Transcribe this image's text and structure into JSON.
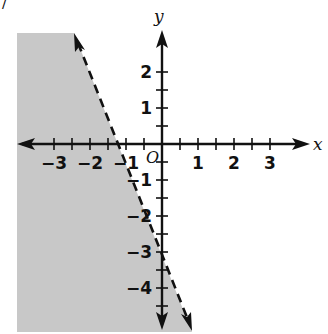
{
  "chart_data": {
    "type": "inequality-graph",
    "title": "",
    "xlabel": "x",
    "ylabel": "y",
    "origin_label": "O",
    "xlim": [
      -3.9,
      4.0
    ],
    "ylim": [
      -5.2,
      3.1
    ],
    "x_tick_step": 0.5,
    "y_tick_step": 0.5,
    "x_tick_labels": [
      "−3",
      "−2",
      "−1",
      "1",
      "2",
      "3"
    ],
    "x_tick_values": [
      -3,
      -2,
      -1,
      1,
      2,
      3
    ],
    "y_tick_labels": [
      "2",
      "1",
      "−1",
      "−2",
      "−3",
      "−4"
    ],
    "y_tick_values": [
      2,
      1,
      -1,
      -2,
      -3,
      -4
    ],
    "boundary_line": {
      "equation": "y = -2.5x - 3",
      "slope": -2.5,
      "intercept": -3,
      "style": "dashed",
      "x_intercept": -1.2
    },
    "inequality": "y < -2.5x - 3",
    "shaded_region": "left of / below the boundary line",
    "shade_color": "#c8c8c8",
    "grid": false
  },
  "fragment": {
    "text": "/"
  },
  "colors": {
    "axis": "#111111",
    "shade": "#c8c8c8",
    "line": "#111111"
  }
}
